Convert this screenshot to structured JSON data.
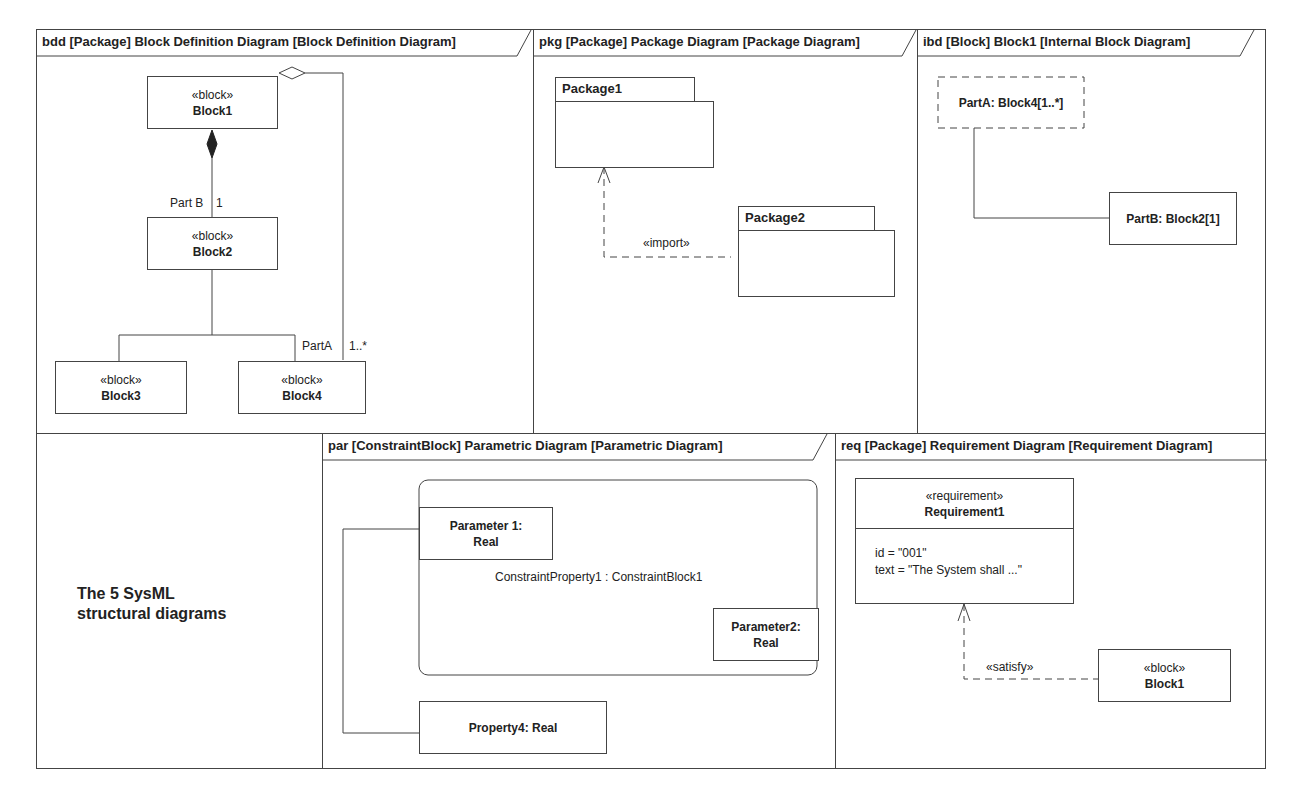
{
  "caption": {
    "line1": "The 5 SysML",
    "line2": "structural diagrams"
  },
  "bdd": {
    "title": "bdd [Package] Block Definition Diagram [Block Definition Diagram]",
    "blocks": [
      {
        "stereotype": "«block»",
        "name": "Block1"
      },
      {
        "stereotype": "«block»",
        "name": "Block2"
      },
      {
        "stereotype": "«block»",
        "name": "Block3"
      },
      {
        "stereotype": "«block»",
        "name": "Block4"
      }
    ],
    "labels": {
      "partB": "Part B",
      "partB_mult": "1",
      "partA": "PartA",
      "partA_mult": "1..*"
    }
  },
  "pkg": {
    "title": "pkg [Package] Package Diagram [Package Diagram]",
    "packages": [
      {
        "name": "Package1"
      },
      {
        "name": "Package2"
      }
    ],
    "import_label": "«import»"
  },
  "ibd": {
    "title": "ibd [Block] Block1 [Internal Block Diagram]",
    "parts": [
      {
        "label": "PartA: Block4[1..*]"
      },
      {
        "label": "PartB: Block2[1]"
      }
    ]
  },
  "par": {
    "title": "par [ConstraintBlock] Parametric Diagram [Parametric Diagram]",
    "constraint_property": "ConstraintProperty1 : ConstraintBlock1",
    "param1": {
      "line1": "Parameter 1:",
      "line2": "Real"
    },
    "param2": {
      "line1": "Parameter2:",
      "line2": "Real"
    },
    "property4": "Property4: Real"
  },
  "req": {
    "title": "req [Package] Requirement Diagram [Requirement Diagram]",
    "requirement": {
      "stereotype": "«requirement»",
      "name": "Requirement1",
      "id_line": "id = \"001\"",
      "text_line": "text = \"The System shall ...\""
    },
    "satisfy_label": "«satisfy»",
    "block": {
      "stereotype": "«block»",
      "name": "Block1"
    }
  }
}
